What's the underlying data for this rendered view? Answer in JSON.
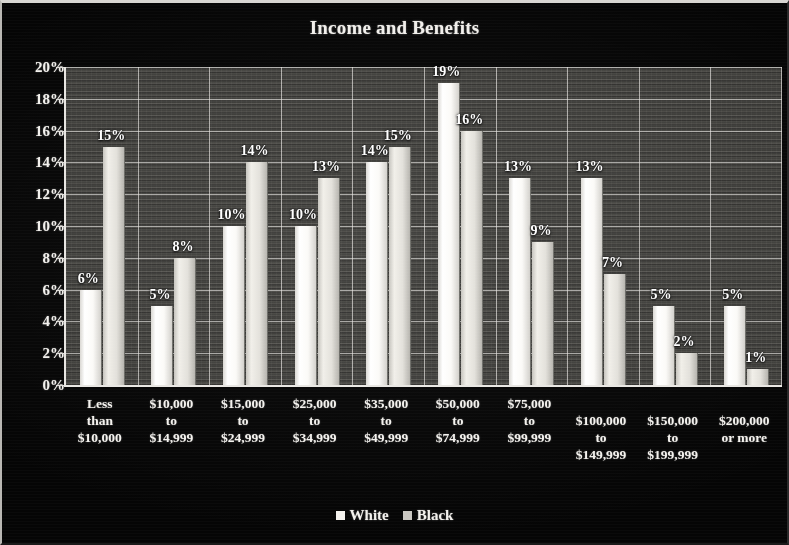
{
  "chart_data": {
    "type": "bar",
    "title": "Income and Benefits",
    "xlabel": "",
    "ylabel": "",
    "ylim": [
      0,
      20
    ],
    "ytick_labels": [
      "20%",
      "18%",
      "16%",
      "14%",
      "12%",
      "10%",
      "8%",
      "6%",
      "4%",
      "2%",
      "0%"
    ],
    "ytick_values": [
      20,
      18,
      16,
      14,
      12,
      10,
      8,
      6,
      4,
      2,
      0
    ],
    "grid": true,
    "legend_position": "bottom",
    "categories": [
      "Less\nthan\n$10,000",
      "$10,000\nto\n$14,999",
      "$15,000\nto\n$24,999",
      "$25,000\nto\n$34,999",
      "$35,000\nto\n$49,999",
      "$50,000\nto\n$74,999",
      "$75,000\nto\n$99,999",
      "$100,000\nto\n$149,999",
      "$150,000\nto\n$199,999",
      "$200,000\nor more"
    ],
    "series": [
      {
        "name": "White",
        "values": [
          6,
          5,
          10,
          10,
          14,
          19,
          13,
          13,
          5,
          5
        ],
        "labels": [
          "6%",
          "5%",
          "10%",
          "10%",
          "14%",
          "19%",
          "13%",
          "13%",
          "5%",
          "5%"
        ],
        "color": "#ffffff"
      },
      {
        "name": "Black",
        "values": [
          15,
          8,
          14,
          13,
          15,
          16,
          9,
          7,
          2,
          1
        ],
        "labels": [
          "15%",
          "8%",
          "14%",
          "13%",
          "15%",
          "16%",
          "9%",
          "7%",
          "2%",
          "1%"
        ],
        "color": "#e2e0da"
      }
    ]
  },
  "legend": {
    "entries": [
      {
        "label": "White",
        "swatch": "white"
      },
      {
        "label": "Black",
        "swatch": "black"
      }
    ]
  },
  "colors": {
    "background": "#050505",
    "plot_background": "#4a4945",
    "axis": "#e9e7e3",
    "text": "#f3f1ed"
  }
}
